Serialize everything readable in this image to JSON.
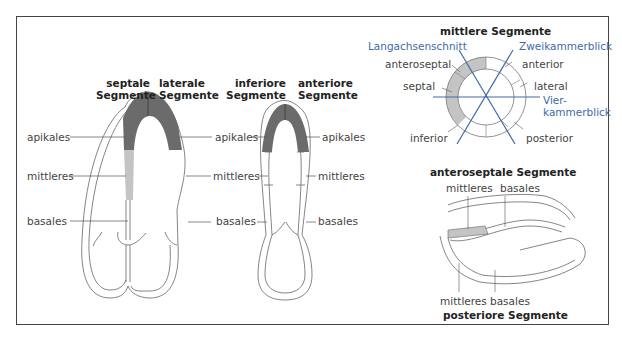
{
  "figure": {
    "long_axis": {
      "headers": {
        "septal": [
          "septale",
          "Segmente"
        ],
        "lateral": [
          "laterale",
          "Segmente"
        ],
        "inferior": [
          "inferiore",
          "Segmente"
        ],
        "anterior": [
          "anteriore",
          "Segmente"
        ]
      },
      "levels": {
        "apical": "apikales",
        "mid": "mittleres",
        "basal": "basales"
      }
    },
    "short_axis": {
      "title": "mittlere Segmente",
      "planes": {
        "long_axis": "Langachsenschnitt",
        "two_chamber": "Zweikammerblick",
        "four_chamber_1": "Vier-",
        "four_chamber_2": "kammerblick"
      },
      "segments": {
        "anteroseptal": "anteroseptal",
        "septal": "septal",
        "inferior": "inferior",
        "anterior": "anterior",
        "lateral": "lateral",
        "posterior": "posterior"
      }
    },
    "parasternal": {
      "top_title": "anteroseptale Segmente",
      "bottom_title": "posteriore Segmente",
      "mid": "mittleres",
      "basal": "basales"
    },
    "colors": {
      "dark_segment": "#6b6b6b",
      "light_segment": "#c4c4c4",
      "plane_lines": "#3e6aa8",
      "outline": "#555555"
    }
  }
}
